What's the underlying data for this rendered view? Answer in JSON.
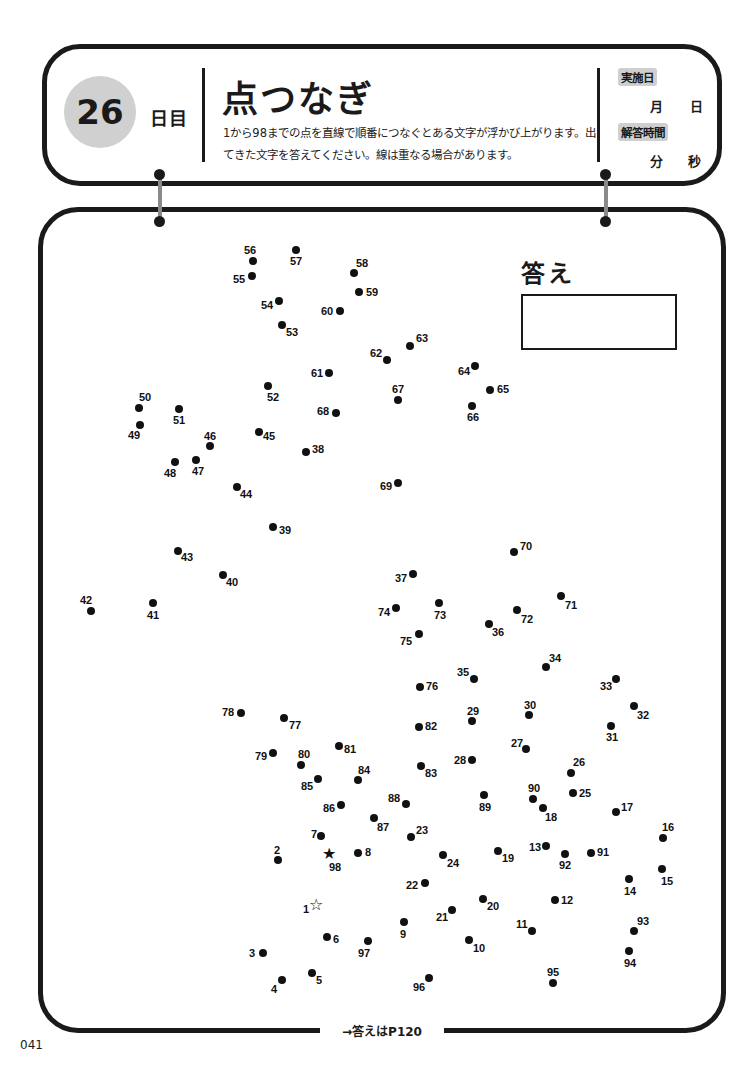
{
  "header": {
    "day_number": "26",
    "day_suffix": "日目",
    "title": "点つなぎ",
    "description": "1から98までの点を直線で順番につなぐとある文字が浮かび上がります。出てきた文字を答えてください。線は重なる場合があります。",
    "date_tag": "実施日",
    "month_unit": "月",
    "day_unit": "日",
    "time_tag": "解答時間",
    "minute_unit": "分",
    "second_unit": "秒"
  },
  "answer": {
    "label": "答え",
    "value": ""
  },
  "footer": {
    "answer_ref": "→答えはP120",
    "page_number": "041"
  },
  "puzzle": {
    "start_marker": "star-outline",
    "end_marker": "star-filled",
    "dots": [
      {
        "n": "1",
        "x": 317,
        "y": 905,
        "lx": -14,
        "ly": -2,
        "type": "start"
      },
      {
        "n": "2",
        "x": 278,
        "y": 860,
        "lx": -4,
        "ly": -16
      },
      {
        "n": "3",
        "x": 263,
        "y": 953,
        "lx": -14,
        "ly": -6
      },
      {
        "n": "4",
        "x": 282,
        "y": 980,
        "lx": -11,
        "ly": 3
      },
      {
        "n": "5",
        "x": 312,
        "y": 973,
        "lx": 4,
        "ly": 1
      },
      {
        "n": "6",
        "x": 327,
        "y": 937,
        "lx": 6,
        "ly": -4
      },
      {
        "n": "7",
        "x": 321,
        "y": 836,
        "lx": -10,
        "ly": -8
      },
      {
        "n": "8",
        "x": 358,
        "y": 853,
        "lx": 7,
        "ly": -7
      },
      {
        "n": "9",
        "x": 404,
        "y": 922,
        "lx": -4,
        "ly": 6
      },
      {
        "n": "10",
        "x": 469,
        "y": 940,
        "lx": 4,
        "ly": 2
      },
      {
        "n": "11",
        "x": 532,
        "y": 931,
        "lx": -16,
        "ly": -13
      },
      {
        "n": "12",
        "x": 555,
        "y": 900,
        "lx": 6,
        "ly": -6
      },
      {
        "n": "13",
        "x": 546,
        "y": 846,
        "lx": -17,
        "ly": -5
      },
      {
        "n": "14",
        "x": 629,
        "y": 879,
        "lx": -5,
        "ly": 6
      },
      {
        "n": "15",
        "x": 662,
        "y": 869,
        "lx": -1,
        "ly": 6
      },
      {
        "n": "16",
        "x": 663,
        "y": 838,
        "lx": -1,
        "ly": -17
      },
      {
        "n": "17",
        "x": 616,
        "y": 812,
        "lx": 5,
        "ly": -11
      },
      {
        "n": "18",
        "x": 543,
        "y": 808,
        "lx": 2,
        "ly": 3
      },
      {
        "n": "19",
        "x": 498,
        "y": 851,
        "lx": 4,
        "ly": 1
      },
      {
        "n": "20",
        "x": 483,
        "y": 899,
        "lx": 4,
        "ly": 1
      },
      {
        "n": "21",
        "x": 452,
        "y": 910,
        "lx": -16,
        "ly": 1
      },
      {
        "n": "22",
        "x": 425,
        "y": 883,
        "lx": -19,
        "ly": -4
      },
      {
        "n": "23",
        "x": 411,
        "y": 837,
        "lx": 5,
        "ly": -13
      },
      {
        "n": "24",
        "x": 443,
        "y": 855,
        "lx": 4,
        "ly": 2
      },
      {
        "n": "25",
        "x": 573,
        "y": 793,
        "lx": 6,
        "ly": -6
      },
      {
        "n": "26",
        "x": 571,
        "y": 773,
        "lx": 2,
        "ly": -17
      },
      {
        "n": "27",
        "x": 526,
        "y": 749,
        "lx": -15,
        "ly": -12
      },
      {
        "n": "28",
        "x": 472,
        "y": 760,
        "lx": -18,
        "ly": -6
      },
      {
        "n": "29",
        "x": 472,
        "y": 721,
        "lx": -5,
        "ly": -16
      },
      {
        "n": "30",
        "x": 529,
        "y": 715,
        "lx": -5,
        "ly": -16
      },
      {
        "n": "31",
        "x": 611,
        "y": 726,
        "lx": -5,
        "ly": 5
      },
      {
        "n": "32",
        "x": 634,
        "y": 706,
        "lx": 3,
        "ly": 3
      },
      {
        "n": "33",
        "x": 616,
        "y": 679,
        "lx": -16,
        "ly": 1
      },
      {
        "n": "34",
        "x": 546,
        "y": 667,
        "lx": 3,
        "ly": -15
      },
      {
        "n": "35",
        "x": 474,
        "y": 679,
        "lx": -17,
        "ly": -13
      },
      {
        "n": "36",
        "x": 489,
        "y": 624,
        "lx": 3,
        "ly": 2
      },
      {
        "n": "37",
        "x": 413,
        "y": 574,
        "lx": -18,
        "ly": -2
      },
      {
        "n": "38",
        "x": 306,
        "y": 452,
        "lx": 6,
        "ly": -9
      },
      {
        "n": "39",
        "x": 273,
        "y": 527,
        "lx": 6,
        "ly": -3
      },
      {
        "n": "40",
        "x": 223,
        "y": 575,
        "lx": 3,
        "ly": 1
      },
      {
        "n": "41",
        "x": 153,
        "y": 603,
        "lx": -6,
        "ly": 6
      },
      {
        "n": "42",
        "x": 91,
        "y": 611,
        "lx": -11,
        "ly": -17
      },
      {
        "n": "43",
        "x": 178,
        "y": 551,
        "lx": 3,
        "ly": 0
      },
      {
        "n": "44",
        "x": 237,
        "y": 487,
        "lx": 3,
        "ly": 1
      },
      {
        "n": "45",
        "x": 259,
        "y": 432,
        "lx": 4,
        "ly": -2
      },
      {
        "n": "46",
        "x": 210,
        "y": 446,
        "lx": -6,
        "ly": -16
      },
      {
        "n": "47",
        "x": 196,
        "y": 460,
        "lx": -4,
        "ly": 5
      },
      {
        "n": "48",
        "x": 175,
        "y": 462,
        "lx": -11,
        "ly": 5
      },
      {
        "n": "49",
        "x": 140,
        "y": 425,
        "lx": -12,
        "ly": 4
      },
      {
        "n": "50",
        "x": 139,
        "y": 408,
        "lx": 0,
        "ly": -17
      },
      {
        "n": "51",
        "x": 179,
        "y": 409,
        "lx": -6,
        "ly": 5
      },
      {
        "n": "52",
        "x": 268,
        "y": 386,
        "lx": -1,
        "ly": 5
      },
      {
        "n": "53",
        "x": 282,
        "y": 325,
        "lx": 4,
        "ly": 1
      },
      {
        "n": "54",
        "x": 279,
        "y": 301,
        "lx": -18,
        "ly": -2
      },
      {
        "n": "55",
        "x": 252,
        "y": 276,
        "lx": -19,
        "ly": -3
      },
      {
        "n": "56",
        "x": 253,
        "y": 261,
        "lx": -9,
        "ly": -17
      },
      {
        "n": "57",
        "x": 296,
        "y": 250,
        "lx": -6,
        "ly": 5
      },
      {
        "n": "58",
        "x": 354,
        "y": 273,
        "lx": 2,
        "ly": -16
      },
      {
        "n": "59",
        "x": 359,
        "y": 292,
        "lx": 7,
        "ly": -6
      },
      {
        "n": "60",
        "x": 340,
        "y": 311,
        "lx": -19,
        "ly": -6
      },
      {
        "n": "61",
        "x": 329,
        "y": 373,
        "lx": -18,
        "ly": -6
      },
      {
        "n": "62",
        "x": 387,
        "y": 360,
        "lx": -17,
        "ly": -13
      },
      {
        "n": "63",
        "x": 410,
        "y": 346,
        "lx": 6,
        "ly": -14
      },
      {
        "n": "64",
        "x": 475,
        "y": 366,
        "lx": -17,
        "ly": -1
      },
      {
        "n": "65",
        "x": 490,
        "y": 390,
        "lx": 7,
        "ly": -7
      },
      {
        "n": "66",
        "x": 472,
        "y": 406,
        "lx": -5,
        "ly": 5
      },
      {
        "n": "67",
        "x": 398,
        "y": 400,
        "lx": -6,
        "ly": -17
      },
      {
        "n": "68",
        "x": 336,
        "y": 413,
        "lx": -19,
        "ly": -8
      },
      {
        "n": "69",
        "x": 398,
        "y": 483,
        "lx": -18,
        "ly": -3
      },
      {
        "n": "70",
        "x": 514,
        "y": 552,
        "lx": 6,
        "ly": -12
      },
      {
        "n": "71",
        "x": 561,
        "y": 596,
        "lx": 4,
        "ly": 3
      },
      {
        "n": "72",
        "x": 517,
        "y": 610,
        "lx": 4,
        "ly": 3
      },
      {
        "n": "73",
        "x": 439,
        "y": 603,
        "lx": -5,
        "ly": 6
      },
      {
        "n": "74",
        "x": 396,
        "y": 608,
        "lx": -18,
        "ly": -2
      },
      {
        "n": "75",
        "x": 419,
        "y": 634,
        "lx": -19,
        "ly": 1
      },
      {
        "n": "76",
        "x": 420,
        "y": 687,
        "lx": 6,
        "ly": -7
      },
      {
        "n": "77",
        "x": 284,
        "y": 718,
        "lx": 5,
        "ly": 1
      },
      {
        "n": "78",
        "x": 241,
        "y": 713,
        "lx": -19,
        "ly": -7
      },
      {
        "n": "79",
        "x": 273,
        "y": 753,
        "lx": -18,
        "ly": -3
      },
      {
        "n": "80",
        "x": 301,
        "y": 765,
        "lx": -3,
        "ly": -17
      },
      {
        "n": "81",
        "x": 339,
        "y": 746,
        "lx": 5,
        "ly": -3
      },
      {
        "n": "82",
        "x": 419,
        "y": 727,
        "lx": 6,
        "ly": -7
      },
      {
        "n": "83",
        "x": 421,
        "y": 766,
        "lx": 4,
        "ly": 1
      },
      {
        "n": "84",
        "x": 358,
        "y": 780,
        "lx": 0,
        "ly": -16
      },
      {
        "n": "85",
        "x": 318,
        "y": 779,
        "lx": -17,
        "ly": 1
      },
      {
        "n": "86",
        "x": 341,
        "y": 805,
        "lx": -18,
        "ly": -3
      },
      {
        "n": "87",
        "x": 374,
        "y": 818,
        "lx": 3,
        "ly": 3
      },
      {
        "n": "88",
        "x": 406,
        "y": 804,
        "lx": -18,
        "ly": -12
      },
      {
        "n": "89",
        "x": 484,
        "y": 795,
        "lx": -5,
        "ly": 6
      },
      {
        "n": "90",
        "x": 533,
        "y": 799,
        "lx": -5,
        "ly": -17
      },
      {
        "n": "91",
        "x": 591,
        "y": 853,
        "lx": 6,
        "ly": -7
      },
      {
        "n": "92",
        "x": 565,
        "y": 854,
        "lx": -6,
        "ly": 5
      },
      {
        "n": "93",
        "x": 634,
        "y": 931,
        "lx": 3,
        "ly": -16
      },
      {
        "n": "94",
        "x": 629,
        "y": 951,
        "lx": -5,
        "ly": 6
      },
      {
        "n": "95",
        "x": 553,
        "y": 983,
        "lx": -6,
        "ly": -17
      },
      {
        "n": "96",
        "x": 429,
        "y": 978,
        "lx": -16,
        "ly": 3
      },
      {
        "n": "97",
        "x": 368,
        "y": 941,
        "lx": -10,
        "ly": 6
      },
      {
        "n": "98",
        "x": 330,
        "y": 854,
        "lx": -1,
        "ly": 7,
        "type": "end"
      }
    ]
  }
}
